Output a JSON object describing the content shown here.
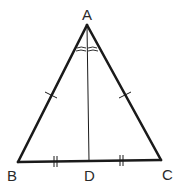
{
  "diagram": {
    "type": "isosceles-triangle-with-median",
    "points": {
      "A": {
        "label": "A",
        "x": 87,
        "y": 24
      },
      "B": {
        "label": "B",
        "x": 18,
        "y": 163
      },
      "C": {
        "label": "C",
        "x": 161,
        "y": 161
      },
      "D": {
        "label": "D",
        "x": 89,
        "y": 162
      }
    },
    "segments": [
      "AB",
      "AC",
      "BC",
      "AD"
    ],
    "marks": {
      "AB": "single-tick",
      "AC": "single-tick",
      "BD": "double-tick",
      "DC": "double-tick",
      "angle_BAD": "double-arc",
      "angle_CAD": "double-arc"
    },
    "colors": {
      "stroke": "#1a1a1a",
      "background": "#ffffff"
    }
  }
}
